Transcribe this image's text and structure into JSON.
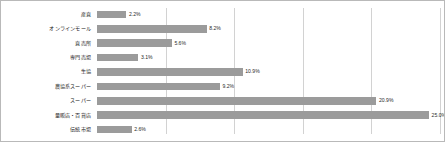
{
  "chart_data": {
    "type": "bar",
    "orientation": "horizontal",
    "title": "",
    "xlabel": "",
    "ylabel": "",
    "xlim": [
      0,
      25.5
    ],
    "grid": true,
    "gridlines": [
      5,
      10,
      15,
      20,
      25
    ],
    "legend": "none",
    "value_suffix": "%",
    "categories": [
      "産直",
      "オンラインモール",
      "直売所",
      "専門売場",
      "生協",
      "農協系スーパー",
      "スーパー",
      "量販店・百貨店",
      "伝統市場"
    ],
    "values": [
      2.2,
      8.2,
      5.6,
      3.1,
      10.9,
      9.2,
      20.9,
      25.0,
      2.6
    ],
    "labels": [
      "2.2%",
      "8.2%",
      "5.6%",
      "3.1%",
      "10.9%",
      "9.2%",
      "20.9%",
      "25.0%",
      "2.6%"
    ],
    "bar_color": "#9b9b9b",
    "grid_color": "#d2d2d2",
    "border_color": "#b9b9b9",
    "text_color": "#222222"
  }
}
